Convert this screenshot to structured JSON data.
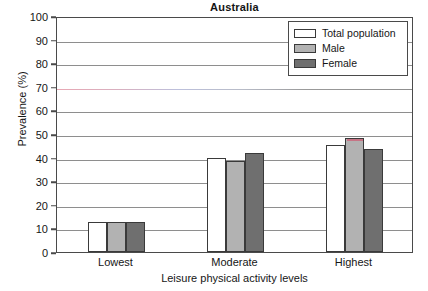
{
  "chart_data": {
    "type": "bar",
    "title": "Australia",
    "xlabel": "Leisure physical activity levels",
    "ylabel": "Prevalence (%)",
    "categories": [
      "Lowest",
      "Moderate",
      "Highest"
    ],
    "series": [
      {
        "name": "Total population",
        "values": [
          12.7,
          40.0,
          45.5
        ],
        "color": "#ffffff"
      },
      {
        "name": "Male",
        "values": [
          12.7,
          38.5,
          48.5
        ],
        "color": "#b2b2b2"
      },
      {
        "name": "Female",
        "values": [
          12.9,
          42.0,
          43.5
        ],
        "color": "#6f6f6f"
      }
    ],
    "ylim": [
      0,
      100
    ],
    "yticks": [
      0,
      10,
      20,
      30,
      40,
      50,
      60,
      70,
      80,
      90,
      100
    ],
    "ytick_labels": [
      "0",
      "10",
      "20",
      "30",
      "40",
      "50",
      "60",
      "70",
      "80",
      "90",
      "100"
    ],
    "grid": true,
    "legend_position": "top-right",
    "legend_entries": [
      "Total population",
      "Male",
      "Female"
    ]
  },
  "legend": {
    "items": [
      {
        "label": "Total population",
        "swatch": "total"
      },
      {
        "label": "Male",
        "swatch": "male"
      },
      {
        "label": "Female",
        "swatch": "female"
      }
    ]
  }
}
